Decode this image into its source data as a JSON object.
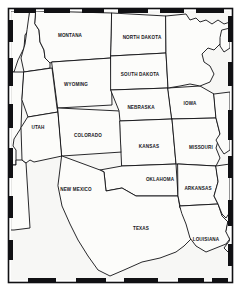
{
  "figure": {
    "kind": "outline-map",
    "region_title": "Central and Western United States",
    "width": 241,
    "height": 291,
    "background_color": "#f7f7f5",
    "land_fill_color": "#fcfcfa",
    "line_color": "#111114",
    "label_color": "#16161a",
    "border_style": "segmented-neatline"
  },
  "labels": [
    {
      "name": "montana",
      "text": "MONTANA",
      "x": 70,
      "y": 36
    },
    {
      "name": "north-dakota",
      "text": "NORTH DAKOTA",
      "x": 142,
      "y": 38
    },
    {
      "name": "south-dakota",
      "text": "SOUTH DAKOTA",
      "x": 140,
      "y": 75
    },
    {
      "name": "wyoming",
      "text": "WYOMING",
      "x": 76,
      "y": 85
    },
    {
      "name": "nebraska",
      "text": "NEBRASKA",
      "x": 141,
      "y": 108
    },
    {
      "name": "iowa",
      "text": "IOWA",
      "x": 190,
      "y": 104
    },
    {
      "name": "utah",
      "text": "UTAH",
      "x": 38,
      "y": 128
    },
    {
      "name": "colorado",
      "text": "COLORADO",
      "x": 88,
      "y": 136
    },
    {
      "name": "kansas",
      "text": "KANSAS",
      "x": 149,
      "y": 147
    },
    {
      "name": "missouri",
      "text": "MISSOURI",
      "x": 201,
      "y": 148
    },
    {
      "name": "new-mexico",
      "text": "NEW MEXICO",
      "x": 76,
      "y": 190
    },
    {
      "name": "oklahoma",
      "text": "OKLAHOMA",
      "x": 160,
      "y": 180
    },
    {
      "name": "arkansas",
      "text": "ARKANSAS",
      "x": 198,
      "y": 189
    },
    {
      "name": "texas",
      "text": "TEXAS",
      "x": 141,
      "y": 229
    },
    {
      "name": "louisiana",
      "text": "LOUISIANA",
      "x": 206,
      "y": 240
    }
  ],
  "neatline": {
    "top_blocks": [
      [
        14,
        22
      ],
      [
        44,
        26
      ],
      [
        82,
        22
      ],
      [
        118,
        30
      ],
      [
        160,
        24
      ],
      [
        196,
        28
      ]
    ],
    "bottom_blocks": [
      [
        28,
        28
      ],
      [
        76,
        30
      ],
      [
        124,
        34
      ],
      [
        178,
        26
      ],
      [
        212,
        16
      ]
    ],
    "left_blocks": [
      [
        20,
        22
      ],
      [
        58,
        28
      ],
      [
        104,
        24
      ],
      [
        148,
        30
      ],
      [
        196,
        22
      ],
      [
        240,
        20
      ]
    ],
    "right_blocks": [
      [
        16,
        26
      ],
      [
        62,
        24
      ],
      [
        110,
        30
      ],
      [
        156,
        22
      ],
      [
        200,
        26
      ],
      [
        244,
        22
      ]
    ]
  },
  "chart_data": {
    "type": "map",
    "states": [
      "MONTANA",
      "NORTH DAKOTA",
      "SOUTH DAKOTA",
      "WYOMING",
      "NEBRASKA",
      "IOWA",
      "UTAH",
      "COLORADO",
      "KANSAS",
      "MISSOURI",
      "NEW MEXICO",
      "OKLAHOMA",
      "ARKANSAS",
      "TEXAS",
      "LOUISIANA"
    ],
    "state_count": 15,
    "legend": [],
    "grid": false
  }
}
